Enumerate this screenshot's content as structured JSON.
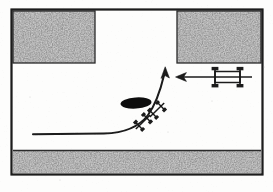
{
  "figure": {
    "canvas": {
      "width": 273,
      "height": 192
    },
    "background_color": "#fdfdfc",
    "ink_color": "#1a1a1a",
    "stipple_color": "#b9b9b9"
  },
  "frame": {
    "name": "diagram-border",
    "x": 11,
    "y": 9,
    "width": 252,
    "height": 166,
    "stroke_width": 2.2,
    "color": "#1a1a1a"
  },
  "blocks": [
    {
      "name": "top-left-block",
      "label": "upper left stippled block",
      "x": 13,
      "y": 11,
      "width": 82,
      "height": 52,
      "fill": "#b9b9b9"
    },
    {
      "name": "top-right-block",
      "label": "upper right stippled block",
      "x": 177,
      "y": 11,
      "width": 84,
      "height": 52,
      "fill": "#b9b9b9"
    },
    {
      "name": "bottom-block",
      "label": "lower stippled strip",
      "x": 13,
      "y": 150,
      "width": 248,
      "height": 23,
      "fill": "#b9b9b9"
    }
  ],
  "median": {
    "name": "median-island",
    "label": "solid black median island",
    "cx": 136,
    "cy": 103,
    "rx": 15,
    "ry": 5.5,
    "rotation": -4,
    "fill": "#111111"
  },
  "turn_path": {
    "name": "turning-path-arrow",
    "label": "curved vehicle turning path arrow",
    "tail": {
      "x": 33,
      "y": 134
    },
    "tip": {
      "x": 165,
      "y": 68
    },
    "stroke_width": 2.0,
    "arrowhead": "up"
  },
  "path_vehicles": [
    {
      "name": "path-axle-symbol-lower",
      "label": "lower axle symbol on turning path",
      "cx": 143,
      "cy": 122,
      "angle": -44
    },
    {
      "name": "path-axle-symbol-upper",
      "label": "upper axle symbol on turning path",
      "cx": 157,
      "cy": 110,
      "angle": -44
    }
  ],
  "truck": {
    "name": "truck-symbol",
    "label": "truck axle symbol travelling left",
    "cx": 228,
    "cy": 77,
    "arrow": {
      "name": "truck-direction-arrow",
      "label": "leftward travel direction arrow",
      "from": {
        "x": 252,
        "y": 77
      },
      "to": {
        "x": 176,
        "y": 77
      },
      "stroke_width": 1.6,
      "arrowhead": "left"
    },
    "axles": [
      {
        "name": "truck-front-axle",
        "x": 215
      },
      {
        "name": "truck-rear-axle",
        "x": 240
      }
    ]
  }
}
